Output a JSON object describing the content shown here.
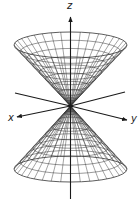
{
  "figure": {
    "width": 140,
    "height": 199,
    "colors": {
      "mesh": "#333333",
      "axis": "#1a1a1a",
      "background": "#ffffff"
    },
    "vertex": {
      "x": 70.5,
      "y": 106
    },
    "cone": {
      "rim_rx": 56.5,
      "rim_ry": 13,
      "top_rim_cy": 45,
      "bottom_rim_cy": 169,
      "radial_lines": 36,
      "rings": 9
    },
    "axes": {
      "z": {
        "label": "z",
        "top": 17,
        "bottom": 199,
        "label_x": 70,
        "label_y": 9
      },
      "x": {
        "label": "x",
        "from": [
          125,
          92
        ],
        "to": [
          17,
          117
        ],
        "label_x": 8,
        "label_y": 121
      },
      "y": {
        "label": "y",
        "from": [
          15,
          93
        ],
        "to": [
          127,
          120
        ],
        "label_x": 131,
        "label_y": 122
      }
    }
  }
}
